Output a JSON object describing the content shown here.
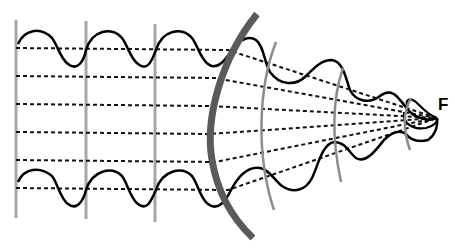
{
  "diagram": {
    "type": "wave-focusing",
    "focus_label": "F",
    "colors": {
      "wave": "#000000",
      "ray": "#111111",
      "plane_wavefront": "#a6a6a6",
      "lens": "#5a5a5a",
      "curved_wavefront": "#8c8c8c",
      "background": "#ffffff"
    },
    "plane_wavefronts_x": [
      16,
      86,
      155
    ],
    "ray_count": 6,
    "curved_wavefront_count": 3,
    "elements": [
      {
        "name": "plane-wavefronts",
        "count": 3
      },
      {
        "name": "incident-rays",
        "count": 6
      },
      {
        "name": "lens",
        "count": 1
      },
      {
        "name": "converging-wavefronts",
        "count": 3
      },
      {
        "name": "wave-envelope-top",
        "count": 1
      },
      {
        "name": "wave-envelope-bottom",
        "count": 1
      },
      {
        "name": "focal-point",
        "label": "F"
      }
    ]
  }
}
